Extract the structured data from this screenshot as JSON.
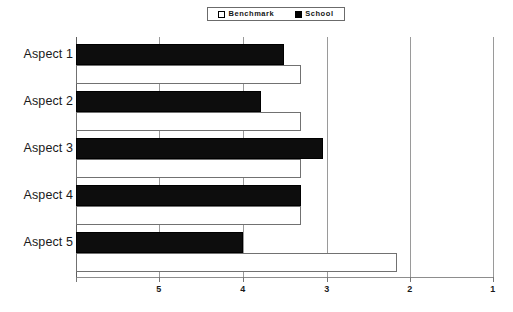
{
  "legend": {
    "position": "top-center",
    "entries": [
      {
        "label": "Benchmark",
        "swatch": "hollow-square-icon",
        "color": "#ffffff"
      },
      {
        "label": "School",
        "swatch": "filled-square-icon",
        "color": "#000000"
      }
    ]
  },
  "axis": {
    "x_ticks": [
      "5",
      "4",
      "3",
      "2",
      "1"
    ],
    "y_categories": [
      "Aspect 1",
      "Aspect 2",
      "Aspect 3",
      "Aspect 4",
      "Aspect 5"
    ]
  },
  "chart_data": {
    "type": "bar",
    "orientation": "horizontal",
    "title": "",
    "xlabel": "",
    "ylabel": "",
    "categories": [
      "Aspect 1",
      "Aspect 2",
      "Aspect 3",
      "Aspect 4",
      "Aspect 5"
    ],
    "xlim": [
      5.35,
      1
    ],
    "x_reversed": true,
    "xticks": [
      5,
      4,
      3,
      2,
      1
    ],
    "grid": true,
    "legend_position": "top-center",
    "series": [
      {
        "name": "Benchmark",
        "color": "#ffffff",
        "edge_color": "#717171",
        "values": [
          3.0,
          3.0,
          3.0,
          3.0,
          2.0
        ]
      },
      {
        "name": "School",
        "color": "#000000",
        "edge_color": "#000000",
        "values": [
          3.18,
          3.42,
          2.77,
          3.0,
          3.61
        ]
      }
    ]
  },
  "colors": {
    "school": "#0d0d0d",
    "benchmark": "#ffffff",
    "benchmark_edge": "#717171",
    "grid": "#9a9a9a",
    "axis": "#5e5e5e",
    "text": "#1a1a1a",
    "background": "#ffffff"
  }
}
